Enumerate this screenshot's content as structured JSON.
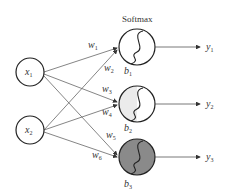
{
  "title": "Softmax",
  "inputs": [
    {
      "label": "x",
      "sub": "1"
    },
    {
      "label": "x",
      "sub": "2"
    }
  ],
  "neurons": [
    {
      "bias": "b",
      "sub": "1",
      "fill": "#ffffff"
    },
    {
      "bias": "b",
      "sub": "2",
      "fill": "#ebebeb"
    },
    {
      "bias": "b",
      "sub": "3",
      "fill": "#8a8a8a"
    }
  ],
  "weights": [
    {
      "label": "w",
      "sub": "1"
    },
    {
      "label": "w",
      "sub": "2"
    },
    {
      "label": "w",
      "sub": "3"
    },
    {
      "label": "w",
      "sub": "4"
    },
    {
      "label": "w",
      "sub": "5"
    },
    {
      "label": "w",
      "sub": "6"
    }
  ],
  "outputs": [
    {
      "label": "y",
      "sub": "1"
    },
    {
      "label": "y",
      "sub": "2"
    },
    {
      "label": "y",
      "sub": "3"
    }
  ],
  "colors": {
    "stroke": "#222222",
    "edge": "#555555"
  }
}
